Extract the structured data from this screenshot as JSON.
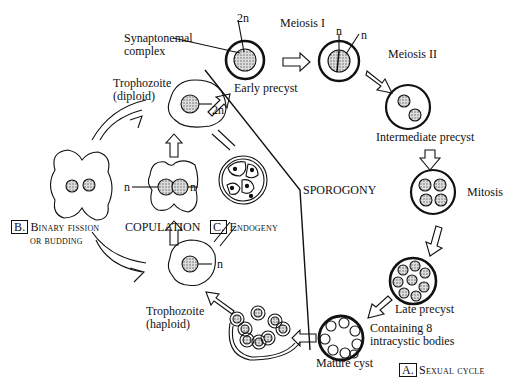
{
  "figure": {
    "sections": {
      "sexual_cycle": {
        "letter": "A.",
        "name": "Sexual cycle"
      },
      "binary_fission": {
        "letter": "B.",
        "name_line1": "Binary fission",
        "name_line2": "or budding"
      },
      "endogeny": {
        "letter": "C.",
        "name": "Endogeny"
      }
    },
    "labels": {
      "synaptonemal_line1": "Synaptonemal",
      "synaptonemal_line2": "complex",
      "two_n_top": "2n",
      "early_precyst": "Early precyst",
      "meiosis1": "Meiosis I",
      "n_a": "n",
      "n_b": "n",
      "meiosis2": "Meiosis II",
      "intermediate_precyst": "Intermediate precyst",
      "mitosis": "Mitosis",
      "sporogony": "SPOROGONY",
      "late_precyst": "Late precyst",
      "containing_line1": "Containing 8",
      "containing_line2": "intracystic bodies",
      "mature_cyst": "Mature cyst",
      "troph_diploid_line1": "Trophozoite",
      "troph_diploid_line2": "(diploid)",
      "two_n_troph": "2n",
      "copulation": "COPULATION",
      "n_left": "n",
      "n_right": "n",
      "troph_haploid_line1": "Trophozoite",
      "troph_haploid_line2": "(haploid)",
      "n_haploid": "n"
    }
  }
}
